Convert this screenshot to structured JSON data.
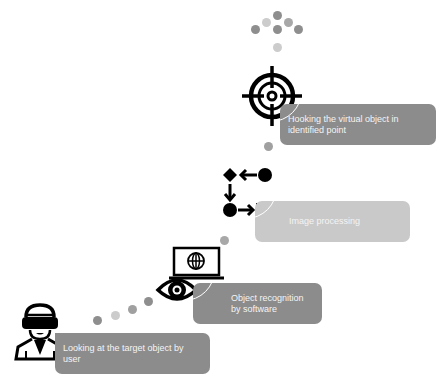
{
  "steps": [
    {
      "label": "Looking at the target object by user",
      "icon": "vr-user-icon"
    },
    {
      "label": "Object recognition by software",
      "icon": "eye-laptop-icon"
    },
    {
      "label": "Image processing",
      "icon": "flowchart-icon"
    },
    {
      "label": "Hooking the virtual object in identified point",
      "icon": "crosshair-target-icon"
    }
  ],
  "colors": {
    "box_dark": "#8c8c8c",
    "box_light": "#c9c9c9",
    "dot_dark": "#8e8e8e",
    "dot_light": "#cccccc",
    "icon": "#000000"
  }
}
